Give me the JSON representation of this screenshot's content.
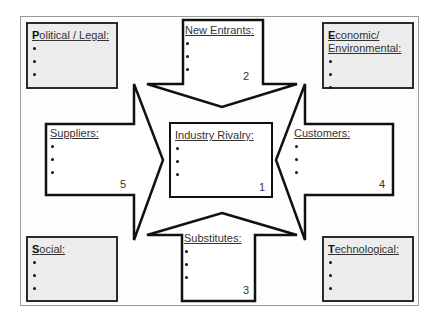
{
  "diagram": {
    "type": "Porter's Five Forces with PEST factors",
    "pest": [
      {
        "id": "political",
        "first": "P",
        "rest": "olitical / Legal:",
        "bullets": [
          "",
          "",
          ""
        ]
      },
      {
        "id": "economic",
        "first": "E",
        "rest": "conomic/",
        "rest2": "Environmental:",
        "bullets": [
          "",
          "",
          ""
        ]
      },
      {
        "id": "social",
        "first": "S",
        "rest": "ocial:",
        "bullets": [
          "",
          "",
          ""
        ]
      },
      {
        "id": "technological",
        "first": "T",
        "rest": "echnological:",
        "bullets": [
          "",
          "",
          ""
        ]
      }
    ],
    "forces": [
      {
        "id": "rivalry",
        "title": "Industry Rivalry:",
        "number": "1",
        "bullets": [
          "",
          "",
          ""
        ]
      },
      {
        "id": "new_entrants",
        "title": "New Entrants:",
        "number": "2",
        "bullets": [
          "",
          "",
          ""
        ]
      },
      {
        "id": "substitutes",
        "title": "Substitutes:",
        "number": "3",
        "bullets": [
          "",
          "",
          ""
        ]
      },
      {
        "id": "customers",
        "title": "Customers:",
        "number": "4",
        "bullets": [
          "",
          "",
          ""
        ]
      },
      {
        "id": "suppliers",
        "title": "Suppliers:",
        "number": "5",
        "bullets": [
          "",
          "",
          ""
        ]
      }
    ]
  }
}
